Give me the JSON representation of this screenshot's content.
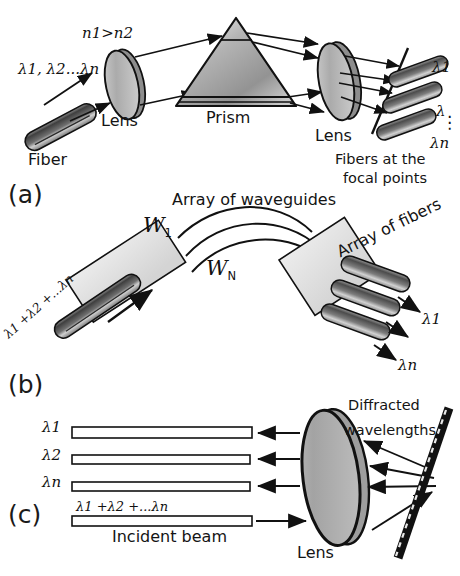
{
  "figure": {
    "background": "#ffffff",
    "ink": "#111111"
  },
  "panels": [
    {
      "id": "a",
      "letter": "(a)",
      "name": "prism-based-demultiplexer",
      "labels": {
        "input_wavelengths": "λ1, λ2...λn",
        "index_condition": "n1>n2",
        "fiber": "Fiber",
        "lens_in": "Lens",
        "prism": "Prism",
        "lens_out": "Lens",
        "out1": "λ1",
        "out2": "λ",
        "out_dots": "⋮",
        "outn": "λn",
        "focal_note_line1": "Fibers at the",
        "focal_note_line2": "focal points"
      }
    },
    {
      "id": "b",
      "letter": "(b)",
      "name": "arrayed-waveguide-grating",
      "labels": {
        "array_of_waveguides": "Array of waveguides",
        "w_first": "W1",
        "w_last": "WN",
        "array_of_fibers": "Array of fibers",
        "input_sum": "λ1 +λ2 +...λn",
        "out1": "λ1",
        "outn": "λn"
      }
    },
    {
      "id": "c",
      "letter": "(c)",
      "name": "diffraction-grating-demultiplexer",
      "labels": {
        "out1": "λ1",
        "out2": "λ2",
        "outn": "λn",
        "incident_sum": "λ1 +λ2 +...λn",
        "incident_beam": "Incident beam",
        "lens": "Lens",
        "diffracted_line1": "Diffracted",
        "diffracted_line2": "wavelengths"
      }
    }
  ],
  "colors": {
    "outline": "#111111",
    "lens_light": "#d8d8d8",
    "lens_mid": "#a8a8a8",
    "lens_dark": "#6e6e6e",
    "prism_light": "#e2e2e2",
    "prism_dark": "#8f8f8f",
    "fiber_dark": "#4a4a4a",
    "fiber_light": "#d5d5d5",
    "slab_fill": "#e0e0e0",
    "beam_fill": "#ffffff"
  }
}
